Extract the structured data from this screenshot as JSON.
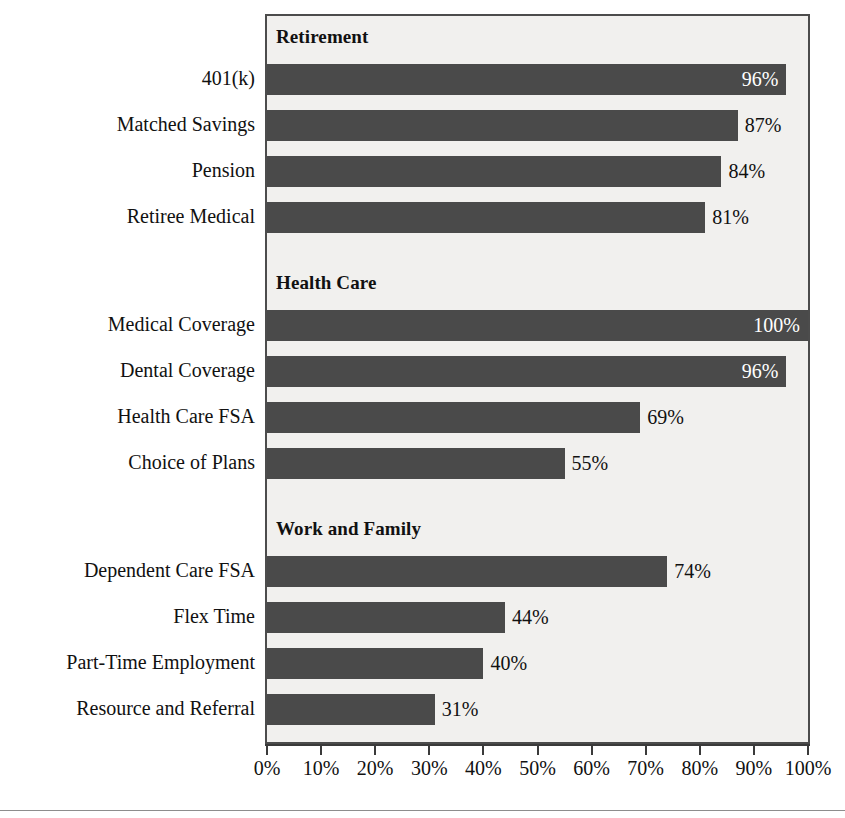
{
  "chart_data": {
    "type": "bar",
    "orientation": "horizontal",
    "title": "",
    "xlabel": "",
    "ylabel": "",
    "xlim": [
      0,
      100
    ],
    "xticks": [
      "0%",
      "10%",
      "20%",
      "30%",
      "40%",
      "50%",
      "60%",
      "70%",
      "80%",
      "90%",
      "100%"
    ],
    "xtick_values": [
      0,
      10,
      20,
      30,
      40,
      50,
      60,
      70,
      80,
      90,
      100
    ],
    "grid": false,
    "legend": "none",
    "value_suffix": "%",
    "bar_color": "#4a4a4a",
    "plot_background": "#f1f0ee",
    "frame_color": "#4c4c4c",
    "inside_label_color": "#ffffff",
    "outside_label_color": "#111111",
    "groups": [
      {
        "header": "Retirement",
        "categories": [
          "401(k)",
          "Matched Savings",
          "Pension",
          "Retiree Medical"
        ],
        "values": [
          96,
          87,
          84,
          81
        ],
        "labels": [
          "96%",
          "87%",
          "84%",
          "81%"
        ],
        "label_inside": [
          true,
          false,
          false,
          false
        ]
      },
      {
        "header": "Health Care",
        "categories": [
          "Medical Coverage",
          "Dental Coverage",
          "Health Care FSA",
          "Choice of Plans"
        ],
        "values": [
          100,
          96,
          69,
          55
        ],
        "labels": [
          "100%",
          "96%",
          "69%",
          "55%"
        ],
        "label_inside": [
          true,
          true,
          false,
          false
        ]
      },
      {
        "header": "Work and Family",
        "categories": [
          "Dependent Care FSA",
          "Flex Time",
          "Part-Time Employment",
          "Resource and Referral"
        ],
        "values": [
          74,
          44,
          40,
          31
        ],
        "labels": [
          "74%",
          "44%",
          "40%",
          "31%"
        ],
        "label_inside": [
          false,
          false,
          false,
          false
        ]
      }
    ]
  }
}
